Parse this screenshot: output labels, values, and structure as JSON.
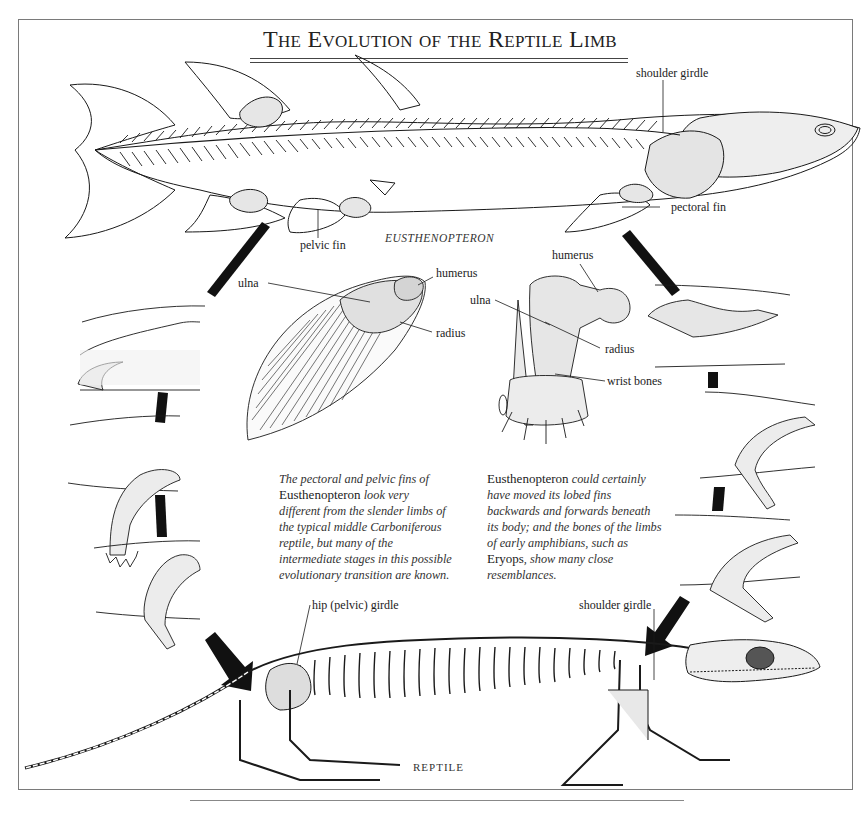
{
  "title": "The Evolution of the Reptile Limb",
  "stages": {
    "fish": {
      "name": "EUSTHENOPTERON",
      "labels": {
        "shoulder_girdle": "shoulder girdle",
        "pectoral_fin": "pectoral fin",
        "pelvic_fin": "pelvic fin"
      }
    },
    "fin_detail": {
      "labels": {
        "humerus": "humerus",
        "ulna": "ulna",
        "radius": "radius"
      }
    },
    "limb_detail": {
      "labels": {
        "humerus": "humerus",
        "ulna": "ulna",
        "radius": "radius",
        "wrist_bones": "wrist bones"
      }
    },
    "reptile": {
      "name": "REPTILE",
      "labels": {
        "hip_girdle": "hip (pelvic) girdle",
        "shoulder_girdle": "shoulder girdle"
      }
    }
  },
  "captions": {
    "left": {
      "line1": "The pectoral and pelvic fins of",
      "line2_upright": "Eusthenopteron",
      "line2_italic": " look very",
      "line3": "different from the slender limbs of",
      "line4": "the typical middle Carboniferous",
      "line5": "reptile, but many of the",
      "line6": "intermediate stages in this possible",
      "line7": "evolutionary transition are known."
    },
    "right": {
      "line1_upright": "Eusthenopteron",
      "line1_italic": " could certainly",
      "line2": "have moved its lobed fins",
      "line3": "backwards and forwards beneath",
      "line4": "its body; and the bones of the limbs",
      "line5": "of early amphibians, such as",
      "line6_upright": "Eryops",
      "line6_italic": ", show many close",
      "line7": "resemblances."
    }
  },
  "transition_panels": {
    "left_side": [
      "fin stage 1",
      "fin stage 2 (paddle with digits)",
      "fin stage 3 (bent limb)"
    ],
    "right_side": [
      "fin stage 1",
      "fin stage 2 (bent limb)",
      "fin stage 3 (limb with digits)"
    ]
  },
  "colors": {
    "ink": "#1a1a1a",
    "frame": "#7a7a7a",
    "arrow": "#111111",
    "shading": "#d9d9d9"
  }
}
